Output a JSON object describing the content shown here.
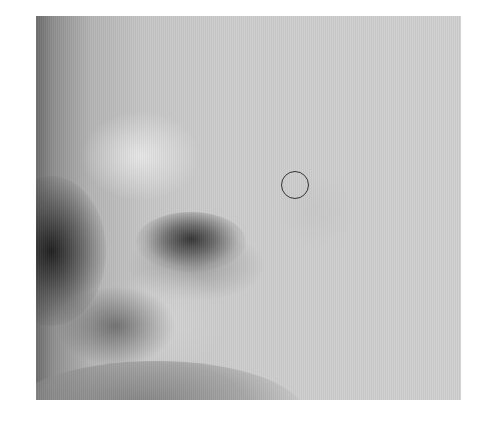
{
  "image": {
    "description": "Grayscale close-up photograph of a face showing the nose, nostril, and cheek region",
    "colors": {
      "background": "#ffffff",
      "skin_light": "#d0d0d0",
      "shadow_dark": "#2d2d2d",
      "marker_stroke": "#333333"
    }
  },
  "annotation": {
    "type": "circle-marker",
    "center": [
      296,
      186
    ],
    "radius": 15
  }
}
